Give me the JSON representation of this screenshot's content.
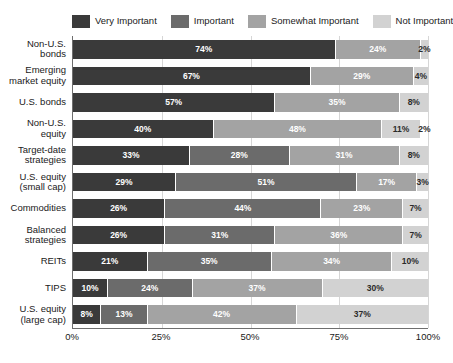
{
  "chart_data": {
    "type": "bar",
    "orientation": "horizontal",
    "stacked": true,
    "title": "",
    "subtitle": "",
    "xlabel": "",
    "ylabel": "",
    "xlim": [
      0,
      100
    ],
    "xticks": [
      "0%",
      "25%",
      "50%",
      "75%",
      "100%"
    ],
    "xtick_values": [
      0,
      25,
      50,
      75,
      100
    ],
    "grid": true,
    "legend_position": "top",
    "legend": [
      {
        "label": "Very Important",
        "color": "#3a3a3a",
        "swatch": "legend-swatch-very-important"
      },
      {
        "label": "Important",
        "color": "#6b6b6b",
        "swatch": "legend-swatch-important"
      },
      {
        "label": "Somewhat Important",
        "color": "#a3a3a3",
        "swatch": "legend-swatch-somewhat-important"
      },
      {
        "label": "Not Important",
        "color": "#d2d2d2",
        "swatch": "legend-swatch-not-important"
      }
    ],
    "series": [
      {
        "name": "Very Important",
        "color": "#3a3a3a",
        "values": [
          74,
          67,
          57,
          40,
          33,
          29,
          26,
          26,
          21,
          10,
          8
        ]
      },
      {
        "name": "Important",
        "color": "#6b6b6b",
        "values": [
          0,
          0,
          0,
          0,
          28,
          51,
          44,
          31,
          35,
          24,
          13
        ]
      },
      {
        "name": "Somewhat Important",
        "color": "#a3a3a3",
        "values": [
          24,
          29,
          35,
          48,
          31,
          17,
          23,
          36,
          34,
          37,
          42
        ]
      },
      {
        "name": "Not Important",
        "color": "#d2d2d2",
        "values": [
          2,
          4,
          8,
          11,
          8,
          3,
          7,
          7,
          10,
          30,
          37
        ]
      }
    ],
    "categories": [
      "Non-U.S. bonds",
      "Emerging market equity",
      "U.S. bonds",
      "Non-U.S. equity",
      "Target-date strategies",
      "U.S. equity (small cap)",
      "Commodities",
      "Balanced strategies",
      "REITs",
      "TIPS",
      "U.S. equity (large cap)"
    ],
    "rows": [
      {
        "label_lines": [
          "Non-U.S.",
          "bonds"
        ],
        "segments": [
          {
            "series": "Very Important",
            "value": 74,
            "label": "74%",
            "color": "#3a3a3a",
            "text": "light"
          },
          {
            "series": "Somewhat Important",
            "value": 24,
            "label": "24%",
            "color": "#a3a3a3",
            "text": "light"
          },
          {
            "series": "Not Important",
            "value": 2,
            "label": "2%",
            "color": "#d2d2d2",
            "text": "dark"
          }
        ]
      },
      {
        "label_lines": [
          "Emerging",
          "market equity"
        ],
        "segments": [
          {
            "series": "Very Important",
            "value": 67,
            "label": "67%",
            "color": "#3a3a3a",
            "text": "light"
          },
          {
            "series": "Somewhat Important",
            "value": 29,
            "label": "29%",
            "color": "#a3a3a3",
            "text": "light"
          },
          {
            "series": "Not Important",
            "value": 4,
            "label": "4%",
            "color": "#d2d2d2",
            "text": "dark"
          }
        ]
      },
      {
        "label_lines": [
          "U.S. bonds"
        ],
        "segments": [
          {
            "series": "Very Important",
            "value": 57,
            "label": "57%",
            "color": "#3a3a3a",
            "text": "light"
          },
          {
            "series": "Somewhat Important",
            "value": 35,
            "label": "35%",
            "color": "#a3a3a3",
            "text": "light"
          },
          {
            "series": "Not Important",
            "value": 8,
            "label": "8%",
            "color": "#d2d2d2",
            "text": "dark"
          }
        ]
      },
      {
        "label_lines": [
          "Non-U.S.",
          "equity"
        ],
        "segments": [
          {
            "series": "Very Important",
            "value": 40,
            "label": "40%",
            "color": "#3a3a3a",
            "text": "light"
          },
          {
            "series": "Somewhat Important",
            "value": 48,
            "label": "48%",
            "color": "#a3a3a3",
            "text": "light"
          },
          {
            "series": "Not Important",
            "value": 11,
            "label": "11%",
            "color": "#d2d2d2",
            "text": "dark"
          },
          {
            "series": "Not Important",
            "value": 2,
            "label": "2%",
            "color": "#ffffff",
            "text": "dark"
          }
        ]
      },
      {
        "label_lines": [
          "Target-date",
          "strategies"
        ],
        "segments": [
          {
            "series": "Very Important",
            "value": 33,
            "label": "33%",
            "color": "#3a3a3a",
            "text": "light"
          },
          {
            "series": "Important",
            "value": 28,
            "label": "28%",
            "color": "#6b6b6b",
            "text": "light"
          },
          {
            "series": "Somewhat Important",
            "value": 31,
            "label": "31%",
            "color": "#a3a3a3",
            "text": "light"
          },
          {
            "series": "Not Important",
            "value": 8,
            "label": "8%",
            "color": "#d2d2d2",
            "text": "dark"
          }
        ]
      },
      {
        "label_lines": [
          "U.S. equity",
          "(small cap)"
        ],
        "segments": [
          {
            "series": "Very Important",
            "value": 29,
            "label": "29%",
            "color": "#3a3a3a",
            "text": "light"
          },
          {
            "series": "Important",
            "value": 51,
            "label": "51%",
            "color": "#6b6b6b",
            "text": "light"
          },
          {
            "series": "Somewhat Important",
            "value": 17,
            "label": "17%",
            "color": "#a3a3a3",
            "text": "light"
          },
          {
            "series": "Not Important",
            "value": 3,
            "label": "3%",
            "color": "#d2d2d2",
            "text": "dark"
          }
        ]
      },
      {
        "label_lines": [
          "Commodities"
        ],
        "segments": [
          {
            "series": "Very Important",
            "value": 26,
            "label": "26%",
            "color": "#3a3a3a",
            "text": "light"
          },
          {
            "series": "Important",
            "value": 44,
            "label": "44%",
            "color": "#6b6b6b",
            "text": "light"
          },
          {
            "series": "Somewhat Important",
            "value": 23,
            "label": "23%",
            "color": "#a3a3a3",
            "text": "light"
          },
          {
            "series": "Not Important",
            "value": 7,
            "label": "7%",
            "color": "#d2d2d2",
            "text": "dark"
          }
        ]
      },
      {
        "label_lines": [
          "Balanced",
          "strategies"
        ],
        "segments": [
          {
            "series": "Very Important",
            "value": 26,
            "label": "26%",
            "color": "#3a3a3a",
            "text": "light"
          },
          {
            "series": "Important",
            "value": 31,
            "label": "31%",
            "color": "#6b6b6b",
            "text": "light"
          },
          {
            "series": "Somewhat Important",
            "value": 36,
            "label": "36%",
            "color": "#a3a3a3",
            "text": "light"
          },
          {
            "series": "Not Important",
            "value": 7,
            "label": "7%",
            "color": "#d2d2d2",
            "text": "dark"
          }
        ]
      },
      {
        "label_lines": [
          "REITs"
        ],
        "segments": [
          {
            "series": "Very Important",
            "value": 21,
            "label": "21%",
            "color": "#3a3a3a",
            "text": "light"
          },
          {
            "series": "Important",
            "value": 35,
            "label": "35%",
            "color": "#6b6b6b",
            "text": "light"
          },
          {
            "series": "Somewhat Important",
            "value": 34,
            "label": "34%",
            "color": "#a3a3a3",
            "text": "light"
          },
          {
            "series": "Not Important",
            "value": 10,
            "label": "10%",
            "color": "#d2d2d2",
            "text": "dark"
          }
        ]
      },
      {
        "label_lines": [
          "TIPS"
        ],
        "segments": [
          {
            "series": "Very Important",
            "value": 10,
            "label": "10%",
            "color": "#3a3a3a",
            "text": "light"
          },
          {
            "series": "Important",
            "value": 24,
            "label": "24%",
            "color": "#6b6b6b",
            "text": "light"
          },
          {
            "series": "Somewhat Important",
            "value": 37,
            "label": "37%",
            "color": "#a3a3a3",
            "text": "light"
          },
          {
            "series": "Not Important",
            "value": 30,
            "label": "30%",
            "color": "#d2d2d2",
            "text": "dark"
          }
        ]
      },
      {
        "label_lines": [
          "U.S. equity",
          "(large cap)"
        ],
        "segments": [
          {
            "series": "Very Important",
            "value": 8,
            "label": "8%",
            "color": "#3a3a3a",
            "text": "light"
          },
          {
            "series": "Important",
            "value": 13,
            "label": "13%",
            "color": "#6b6b6b",
            "text": "light"
          },
          {
            "series": "Somewhat Important",
            "value": 42,
            "label": "42%",
            "color": "#a3a3a3",
            "text": "light"
          },
          {
            "series": "Not Important",
            "value": 37,
            "label": "37%",
            "color": "#d2d2d2",
            "text": "dark"
          }
        ]
      }
    ]
  }
}
